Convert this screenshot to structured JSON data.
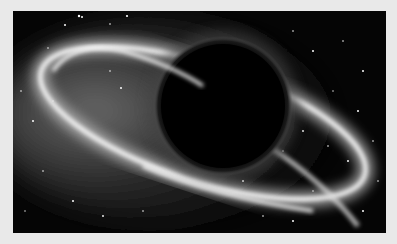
{
  "image": {
    "subject": "black hole with glowing accretion ring in starfield",
    "colors": {
      "border": "#e9e9e9",
      "space": "#050505",
      "glow": "#ffffff",
      "hole": "#000000"
    }
  }
}
